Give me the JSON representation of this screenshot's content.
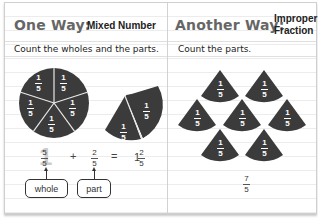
{
  "left_panel": {
    "title_main": "One Way:",
    "title_sub": "Mixed Number",
    "instruction": "Count the wholes and the parts.",
    "whole_circle_pieces": [
      "1/5",
      "1/5",
      "1/5",
      "1/5",
      "1/5"
    ],
    "partial_pieces": [
      "1/5",
      "1/5"
    ],
    "equation": {
      "whole_num": "5",
      "whole_den": "5",
      "whole_digit": "1",
      "plus": "+",
      "part_num": "2",
      "part_den": "5",
      "equals": "=",
      "result_whole": "1",
      "result_num": "2",
      "result_den": "5"
    },
    "labels": {
      "whole": "whole",
      "part": "part"
    }
  },
  "right_panel": {
    "title_main": "Another Way:",
    "title_sub_line1": "Improper",
    "title_sub_line2": "Fraction",
    "instruction": "Count the parts.",
    "pieces": [
      "1/5",
      "1/5",
      "1/5",
      "1/5",
      "1/5",
      "1/5",
      "1/5"
    ],
    "result_num": "7",
    "result_den": "5"
  },
  "colors": {
    "piece_fill": "#3b3b3b",
    "piece_text": "#ffffff",
    "title_gray": "#666666",
    "rule_line": "#ececec"
  },
  "piece_label": {
    "num": "1",
    "den": "5"
  }
}
